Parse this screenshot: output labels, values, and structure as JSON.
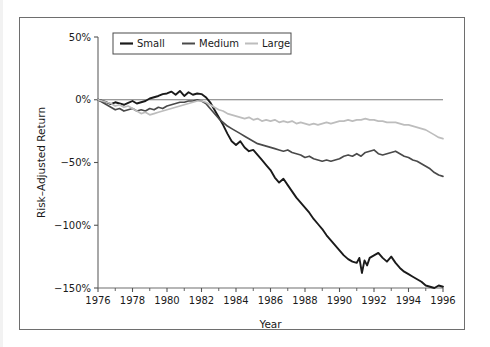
{
  "chart_data": {
    "type": "line",
    "title": "",
    "xlabel": "Year",
    "ylabel": "Risk–Adjusted Return",
    "xlim": [
      1976,
      1996
    ],
    "ylim": [
      -150,
      50
    ],
    "xticks": [
      1976,
      1978,
      1980,
      1982,
      1984,
      1986,
      1988,
      1990,
      1992,
      1994,
      1996
    ],
    "xtick_labels": [
      "1976",
      "1978",
      "1980",
      "1982",
      "1984",
      "1986",
      "1988",
      "1990",
      "1992",
      "1994",
      "1996"
    ],
    "yticks": [
      50,
      0,
      -50,
      -100,
      -150
    ],
    "ytick_labels": [
      "50%",
      "0%",
      "−50%",
      "−100%",
      "−150%"
    ],
    "grid": false,
    "zero_line": true,
    "legend_position": "top-left",
    "legend_entries": [
      "Small",
      "Medium",
      "Large"
    ],
    "series": [
      {
        "name": "Small",
        "color": "#1a1a1a",
        "width": 1.9,
        "x": [
          1976.0,
          1976.25,
          1976.5,
          1976.75,
          1977.0,
          1977.25,
          1977.5,
          1977.75,
          1978.0,
          1978.25,
          1978.5,
          1978.75,
          1979.0,
          1979.25,
          1979.5,
          1979.75,
          1980.0,
          1980.25,
          1980.5,
          1980.75,
          1981.0,
          1981.25,
          1981.5,
          1981.75,
          1982.0,
          1982.25,
          1982.5,
          1982.75,
          1983.0,
          1983.25,
          1983.5,
          1983.75,
          1984.0,
          1984.25,
          1984.5,
          1984.75,
          1985.0,
          1985.25,
          1985.5,
          1985.75,
          1986.0,
          1986.25,
          1986.5,
          1986.75,
          1987.0,
          1987.25,
          1987.5,
          1987.75,
          1988.0,
          1988.25,
          1988.5,
          1988.75,
          1989.0,
          1989.25,
          1989.5,
          1989.75,
          1990.0,
          1990.25,
          1990.5,
          1990.75,
          1991.0,
          1991.15,
          1991.3,
          1991.45,
          1991.6,
          1991.75,
          1992.0,
          1992.25,
          1992.5,
          1992.75,
          1993.0,
          1993.25,
          1993.5,
          1993.75,
          1994.0,
          1994.25,
          1994.5,
          1994.75,
          1995.0,
          1995.25,
          1995.5,
          1995.75,
          1996.0
        ],
        "y": [
          0,
          -1,
          -2,
          -3.5,
          -2,
          -3,
          -4,
          -2.5,
          -1,
          -3,
          -2,
          -1,
          1,
          2,
          3,
          4.5,
          5,
          6.5,
          4,
          7,
          3,
          6,
          4,
          5,
          4.5,
          2,
          -2,
          -8,
          -14,
          -20,
          -27,
          -33,
          -36,
          -33,
          -38,
          -41,
          -40,
          -44,
          -48,
          -52,
          -56,
          -62,
          -66,
          -63,
          -68,
          -73,
          -78,
          -82,
          -86,
          -90,
          -95,
          -99,
          -103,
          -108,
          -112,
          -116,
          -120,
          -124,
          -127,
          -129,
          -130,
          -126,
          -138,
          -128,
          -132,
          -126,
          -124,
          -122,
          -126,
          -129,
          -125,
          -130,
          -134,
          -137,
          -139,
          -141,
          -143,
          -145,
          -148,
          -149,
          -150,
          -148,
          -149
        ]
      },
      {
        "name": "Medium",
        "color": "#4a4a4a",
        "width": 1.7,
        "x": [
          1976.0,
          1976.25,
          1976.5,
          1976.75,
          1977.0,
          1977.25,
          1977.5,
          1977.75,
          1978.0,
          1978.25,
          1978.5,
          1978.75,
          1979.0,
          1979.25,
          1979.5,
          1979.75,
          1980.0,
          1980.25,
          1980.5,
          1980.75,
          1981.0,
          1981.25,
          1981.5,
          1981.75,
          1982.0,
          1982.25,
          1982.5,
          1982.75,
          1983.0,
          1983.25,
          1983.5,
          1983.75,
          1984.0,
          1984.25,
          1984.5,
          1984.75,
          1985.0,
          1985.25,
          1985.5,
          1985.75,
          1986.0,
          1986.25,
          1986.5,
          1986.75,
          1987.0,
          1987.25,
          1987.5,
          1987.75,
          1988.0,
          1988.25,
          1988.5,
          1988.75,
          1989.0,
          1989.25,
          1989.5,
          1989.75,
          1990.0,
          1990.25,
          1990.5,
          1990.75,
          1991.0,
          1991.25,
          1991.5,
          1991.75,
          1992.0,
          1992.25,
          1992.5,
          1992.75,
          1993.0,
          1993.25,
          1993.5,
          1993.75,
          1994.0,
          1994.25,
          1994.5,
          1994.75,
          1995.0,
          1995.25,
          1995.5,
          1995.75,
          1996.0
        ],
        "y": [
          0,
          -2,
          -4,
          -6,
          -8,
          -7,
          -9,
          -8,
          -7,
          -9,
          -8,
          -9,
          -7,
          -8,
          -6,
          -7,
          -5,
          -4,
          -3,
          -2,
          -2,
          -1,
          -1,
          0,
          -1,
          -3,
          -7,
          -11,
          -15,
          -18,
          -21,
          -23,
          -25,
          -27,
          -29,
          -31,
          -33,
          -35,
          -36,
          -37,
          -38,
          -39,
          -40,
          -41,
          -40,
          -42,
          -43,
          -44,
          -46,
          -45,
          -47,
          -48,
          -49,
          -48,
          -49,
          -48,
          -47,
          -45,
          -44,
          -45,
          -43,
          -45,
          -42,
          -41,
          -40,
          -43,
          -44,
          -43,
          -42,
          -41,
          -43,
          -45,
          -46,
          -48,
          -49,
          -51,
          -53,
          -55,
          -58,
          -60,
          -61
        ]
      },
      {
        "name": "Large",
        "color": "#bdbdbd",
        "width": 1.7,
        "x": [
          1976.0,
          1976.25,
          1976.5,
          1976.75,
          1977.0,
          1977.25,
          1977.5,
          1977.75,
          1978.0,
          1978.25,
          1978.5,
          1978.75,
          1979.0,
          1979.25,
          1979.5,
          1979.75,
          1980.0,
          1980.25,
          1980.5,
          1980.75,
          1981.0,
          1981.25,
          1981.5,
          1981.75,
          1982.0,
          1982.25,
          1982.5,
          1982.75,
          1983.0,
          1983.25,
          1983.5,
          1983.75,
          1984.0,
          1984.25,
          1984.5,
          1984.75,
          1985.0,
          1985.25,
          1985.5,
          1985.75,
          1986.0,
          1986.25,
          1986.5,
          1986.75,
          1987.0,
          1987.25,
          1987.5,
          1987.75,
          1988.0,
          1988.25,
          1988.5,
          1988.75,
          1989.0,
          1989.25,
          1989.5,
          1989.75,
          1990.0,
          1990.25,
          1990.5,
          1990.75,
          1991.0,
          1991.25,
          1991.5,
          1991.75,
          1992.0,
          1992.25,
          1992.5,
          1992.75,
          1993.0,
          1993.25,
          1993.5,
          1993.75,
          1994.0,
          1994.25,
          1994.5,
          1994.75,
          1995.0,
          1995.25,
          1995.5,
          1995.75,
          1996.0
        ],
        "y": [
          0,
          -1,
          -2,
          -3,
          -5,
          -4,
          -6,
          -5,
          -7,
          -9,
          -11,
          -10,
          -12,
          -11,
          -10,
          -9,
          -8,
          -7,
          -6,
          -5,
          -4,
          -3,
          -2,
          -1,
          -1,
          -2,
          -4,
          -6,
          -8,
          -9,
          -11,
          -12,
          -13,
          -14,
          -15,
          -14,
          -16,
          -15,
          -17,
          -16,
          -17,
          -16,
          -18,
          -17,
          -18,
          -17,
          -19,
          -18,
          -19,
          -20,
          -19,
          -20,
          -19,
          -18,
          -19,
          -18,
          -17,
          -17,
          -16,
          -17,
          -16,
          -16,
          -15,
          -16,
          -16,
          -17,
          -17,
          -18,
          -18,
          -18,
          -19,
          -20,
          -20,
          -21,
          -22,
          -23,
          -24,
          -26,
          -28,
          -30,
          -31
        ]
      }
    ]
  },
  "axes": {
    "zero_line_color": "#777777",
    "frame_color": "#6e6e6e",
    "tick_color": "#555555",
    "text_color": "#1a1a1a"
  }
}
